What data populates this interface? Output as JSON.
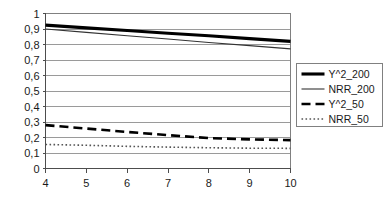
{
  "chart_data": {
    "type": "line",
    "title": "",
    "xlabel": "",
    "ylabel": "",
    "x": [
      4,
      5,
      6,
      7,
      8,
      9,
      10
    ],
    "xlim": [
      4,
      10
    ],
    "ylim": [
      0,
      1
    ],
    "grid": true,
    "legend_position": "right",
    "x_ticks": [
      "4",
      "5",
      "6",
      "7",
      "8",
      "9",
      "10"
    ],
    "y_ticks": [
      "0",
      "0,1",
      "0,2",
      "0,3",
      "0,4",
      "0,5",
      "0,6",
      "0,7",
      "0,8",
      "0,9",
      "1"
    ],
    "y_tick_values": [
      0,
      0.1,
      0.2,
      0.3,
      0.4,
      0.5,
      0.6,
      0.7,
      0.8,
      0.9,
      1
    ],
    "series": [
      {
        "name": "Y^2_200",
        "style": "thick-solid",
        "color": "#000000",
        "values": [
          0.925,
          0.907,
          0.89,
          0.873,
          0.856,
          0.838,
          0.82
        ]
      },
      {
        "name": "NRR_200",
        "style": "thin-solid",
        "color": "#333333",
        "values": [
          0.9,
          0.878,
          0.856,
          0.835,
          0.813,
          0.793,
          0.772
        ]
      },
      {
        "name": "Y^2_50",
        "style": "dashed",
        "color": "#000000",
        "values": [
          0.28,
          0.258,
          0.236,
          0.215,
          0.196,
          0.188,
          0.183
        ]
      },
      {
        "name": "NRR_50",
        "style": "dotted",
        "color": "#555555",
        "values": [
          0.155,
          0.15,
          0.143,
          0.138,
          0.134,
          0.131,
          0.13
        ]
      }
    ]
  },
  "legend": {
    "entries": [
      {
        "label": "Y^2_200"
      },
      {
        "label": "NRR_200"
      },
      {
        "label": "Y^2_50"
      },
      {
        "label": "NRR_50"
      }
    ]
  },
  "colors": {
    "axis": "#808080",
    "grid": "#9a9a9a",
    "text": "#1a1a1a",
    "legend_border": "#808080",
    "background": "#ffffff"
  }
}
